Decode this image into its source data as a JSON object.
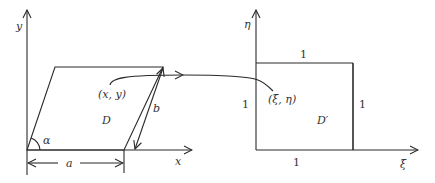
{
  "left_diagram": {
    "axes": {
      "x_label": "x",
      "y_label": "y"
    },
    "region_label": "D",
    "point_label": "(x, y)",
    "angle_label": "α",
    "width_label": "a",
    "side_label": "b"
  },
  "right_diagram": {
    "axes": {
      "x_label": "ξ",
      "y_label": "η"
    },
    "region_label": "D′",
    "point_label": "(ξ, η)",
    "top_side_label": "1",
    "bottom_side_label": "1",
    "left_side_label": "1",
    "right_side_label": "1"
  },
  "colors": {
    "line": "#2a2a2a",
    "text": "#333333",
    "background": "#ffffff"
  }
}
